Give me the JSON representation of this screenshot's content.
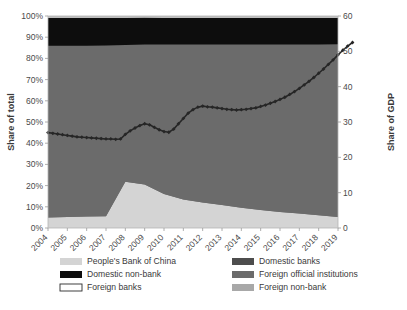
{
  "chart_data": {
    "type": "area",
    "title": "",
    "subtitle": "",
    "ylabel": "Share of total",
    "ylabel_right": "Share of GDP",
    "xlabel": "",
    "grid": false,
    "legend_position": "bottom",
    "categories": [
      "2004",
      "2005",
      "2006",
      "2007",
      "2008",
      "2009",
      "2010",
      "2011",
      "2012",
      "2013",
      "2014",
      "2015",
      "2016",
      "2017",
      "2018",
      "2019"
    ],
    "ytick_labels": [
      "0%",
      "10%",
      "20%",
      "30%",
      "40%",
      "50%",
      "60%",
      "70%",
      "80%",
      "90%",
      "100%"
    ],
    "ytick_values": [
      0,
      10,
      20,
      30,
      40,
      50,
      60,
      70,
      80,
      90,
      100
    ],
    "ylim": [
      0,
      100
    ],
    "ytick_labels_right": [
      "0",
      "10",
      "20",
      "30",
      "40",
      "50",
      "60"
    ],
    "ytick_values_right": [
      0,
      10,
      20,
      30,
      40,
      50,
      60
    ],
    "ylim_right": [
      0,
      60
    ],
    "x": [
      2004,
      2005,
      2006,
      2007,
      2008,
      2009,
      2010,
      2011,
      2012,
      2013,
      2014,
      2015,
      2016,
      2017,
      2018,
      2019
    ],
    "series": [
      {
        "name": "People's Bank of China",
        "color": "#d4d4d4",
        "stack": true,
        "values": [
          5.0,
          5.2,
          5.4,
          5.6,
          21.8,
          20.5,
          16.0,
          13.5,
          12.0,
          10.8,
          9.5,
          8.5,
          7.5,
          6.8,
          6.0,
          5.2
        ]
      },
      {
        "name": "Foreign official institutions",
        "color": "#6b6b6b",
        "stack": true,
        "values": [
          81.0,
          80.8,
          80.6,
          80.5,
          64.5,
          66.0,
          70.5,
          73.0,
          74.5,
          75.8,
          77.0,
          78.0,
          79.0,
          79.8,
          80.5,
          81.5
        ]
      },
      {
        "name": "Domestic non-bank",
        "color": "#0d0d0d",
        "stack": true,
        "values": [
          13.0,
          13.0,
          13.0,
          13.0,
          12.8,
          12.7,
          12.6,
          12.5,
          12.5,
          12.4,
          12.5,
          12.5,
          12.5,
          12.4,
          12.5,
          12.3
        ]
      },
      {
        "name": "Foreign non-bank",
        "color": "#bfbfbf",
        "stack": true,
        "values": [
          1.0,
          1.0,
          1.0,
          0.9,
          0.9,
          0.8,
          0.9,
          1.0,
          1.0,
          1.0,
          1.0,
          1.0,
          1.0,
          1.0,
          1.0,
          1.0
        ]
      }
    ],
    "line_series": {
      "name": "Share of GDP",
      "color": "#262626",
      "axis": "right",
      "marker": "diamond",
      "x": [
        2004.0,
        2004.25,
        2004.5,
        2004.75,
        2005.0,
        2005.25,
        2005.5,
        2005.75,
        2006.0,
        2006.25,
        2006.5,
        2006.75,
        2007.0,
        2007.25,
        2007.5,
        2007.75,
        2008.0,
        2008.25,
        2008.5,
        2008.75,
        2009.0,
        2009.25,
        2009.5,
        2009.75,
        2010.0,
        2010.25,
        2010.5,
        2010.75,
        2011.0,
        2011.25,
        2011.5,
        2011.75,
        2012.0,
        2012.25,
        2012.5,
        2012.75,
        2013.0,
        2013.25,
        2013.5,
        2013.75,
        2014.0,
        2014.25,
        2014.5,
        2014.75,
        2015.0,
        2015.25,
        2015.5,
        2015.75,
        2016.0,
        2016.25,
        2016.5,
        2016.75,
        2017.0,
        2017.25,
        2017.5,
        2017.75,
        2018.0,
        2018.25,
        2018.5,
        2018.75,
        2019.0,
        2019.25,
        2019.5,
        2019.75
      ],
      "values": [
        27.0,
        26.8,
        26.6,
        26.4,
        26.2,
        26.0,
        25.8,
        25.7,
        25.6,
        25.5,
        25.4,
        25.3,
        25.2,
        25.2,
        25.1,
        25.2,
        26.5,
        27.5,
        28.3,
        29.0,
        29.5,
        29.2,
        28.5,
        27.8,
        27.3,
        27.1,
        28.0,
        29.5,
        31.0,
        32.5,
        33.5,
        34.2,
        34.5,
        34.3,
        34.2,
        34.0,
        33.8,
        33.6,
        33.5,
        33.4,
        33.5,
        33.6,
        33.8,
        34.0,
        34.4,
        34.8,
        35.3,
        35.8,
        36.4,
        37.0,
        37.8,
        38.6,
        39.5,
        40.5,
        41.5,
        42.6,
        43.8,
        45.0,
        46.3,
        47.6,
        49.0,
        50.3,
        51.5,
        52.5
      ]
    }
  },
  "legend": {
    "entries": [
      {
        "label": "People's Bank of China",
        "color": "#d4d4d4",
        "border": false
      },
      {
        "label": "Domestic non-bank",
        "color": "#0d0d0d",
        "border": false
      },
      {
        "label": "Foreign banks",
        "color": "#ffffff",
        "border": true
      },
      {
        "label": "Domestic banks",
        "color": "#4d4d4d",
        "border": false
      },
      {
        "label": "Foreign official institutions",
        "color": "#6b6b6b",
        "border": false
      },
      {
        "label": "Foreign non-bank",
        "color": "#a8a8a8",
        "border": false
      }
    ]
  }
}
